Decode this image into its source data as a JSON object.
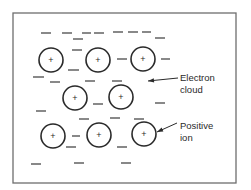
{
  "diagram": {
    "frame": {
      "x": 13,
      "y": 13,
      "width": 223,
      "height": 170
    },
    "ions": [
      {
        "cx": 51,
        "cy": 60,
        "r": 12,
        "symbol": "+"
      },
      {
        "cx": 98,
        "cy": 60,
        "r": 12,
        "symbol": "+"
      },
      {
        "cx": 143,
        "cy": 59,
        "r": 12,
        "symbol": "+"
      },
      {
        "cx": 75,
        "cy": 98,
        "r": 12,
        "symbol": "+"
      },
      {
        "cx": 121,
        "cy": 97,
        "r": 12,
        "symbol": "+"
      },
      {
        "cx": 53,
        "cy": 136,
        "r": 12,
        "symbol": "+"
      },
      {
        "cx": 99,
        "cy": 135,
        "r": 12,
        "symbol": "+"
      },
      {
        "cx": 144,
        "cy": 134,
        "r": 12,
        "symbol": "+"
      }
    ],
    "electrons": [
      {
        "x1": 41,
        "y1": 33,
        "x2": 51,
        "y2": 33
      },
      {
        "x1": 62,
        "y1": 33,
        "x2": 72,
        "y2": 33
      },
      {
        "x1": 82,
        "y1": 33,
        "x2": 91,
        "y2": 33
      },
      {
        "x1": 94,
        "y1": 33,
        "x2": 104,
        "y2": 33
      },
      {
        "x1": 113,
        "y1": 32,
        "x2": 123,
        "y2": 32
      },
      {
        "x1": 128,
        "y1": 32,
        "x2": 138,
        "y2": 32
      },
      {
        "x1": 142,
        "y1": 32,
        "x2": 151,
        "y2": 32
      },
      {
        "x1": 73,
        "y1": 39,
        "x2": 83,
        "y2": 39
      },
      {
        "x1": 155,
        "y1": 38,
        "x2": 165,
        "y2": 38
      },
      {
        "x1": 72,
        "y1": 50,
        "x2": 82,
        "y2": 50
      },
      {
        "x1": 117,
        "y1": 59,
        "x2": 127,
        "y2": 59
      },
      {
        "x1": 161,
        "y1": 59,
        "x2": 170,
        "y2": 59
      },
      {
        "x1": 68,
        "y1": 70,
        "x2": 79,
        "y2": 70
      },
      {
        "x1": 33,
        "y1": 77,
        "x2": 44,
        "y2": 77
      },
      {
        "x1": 50,
        "y1": 82,
        "x2": 60,
        "y2": 82
      },
      {
        "x1": 85,
        "y1": 81,
        "x2": 95,
        "y2": 81
      },
      {
        "x1": 112,
        "y1": 81,
        "x2": 122,
        "y2": 81
      },
      {
        "x1": 93,
        "y1": 104,
        "x2": 103,
        "y2": 104
      },
      {
        "x1": 155,
        "y1": 103,
        "x2": 165,
        "y2": 103
      },
      {
        "x1": 36,
        "y1": 111,
        "x2": 46,
        "y2": 111
      },
      {
        "x1": 79,
        "y1": 119,
        "x2": 89,
        "y2": 119
      },
      {
        "x1": 110,
        "y1": 118,
        "x2": 120,
        "y2": 118
      },
      {
        "x1": 134,
        "y1": 119,
        "x2": 144,
        "y2": 119
      },
      {
        "x1": 72,
        "y1": 136,
        "x2": 80,
        "y2": 136
      },
      {
        "x1": 66,
        "y1": 147,
        "x2": 76,
        "y2": 147
      },
      {
        "x1": 117,
        "y1": 147,
        "x2": 127,
        "y2": 147
      },
      {
        "x1": 31,
        "y1": 164,
        "x2": 41,
        "y2": 164
      },
      {
        "x1": 74,
        "y1": 163,
        "x2": 84,
        "y2": 163
      },
      {
        "x1": 121,
        "y1": 163,
        "x2": 131,
        "y2": 163
      }
    ],
    "labels": {
      "electron_cloud_line1": "Electron",
      "electron_cloud_line2": "cloud",
      "positive_ion_line1": "Positive",
      "positive_ion_line2": "ion"
    },
    "pointers": {
      "electron_cloud": {
        "x1": 178,
        "y1": 78,
        "x2": 148,
        "y2": 81
      },
      "positive_ion": {
        "x1": 177,
        "y1": 123,
        "x2": 157,
        "y2": 132
      }
    },
    "colors": {
      "ink": "#2a2a2a",
      "frame": "#6e6e6e",
      "background": "#ffffff"
    }
  }
}
